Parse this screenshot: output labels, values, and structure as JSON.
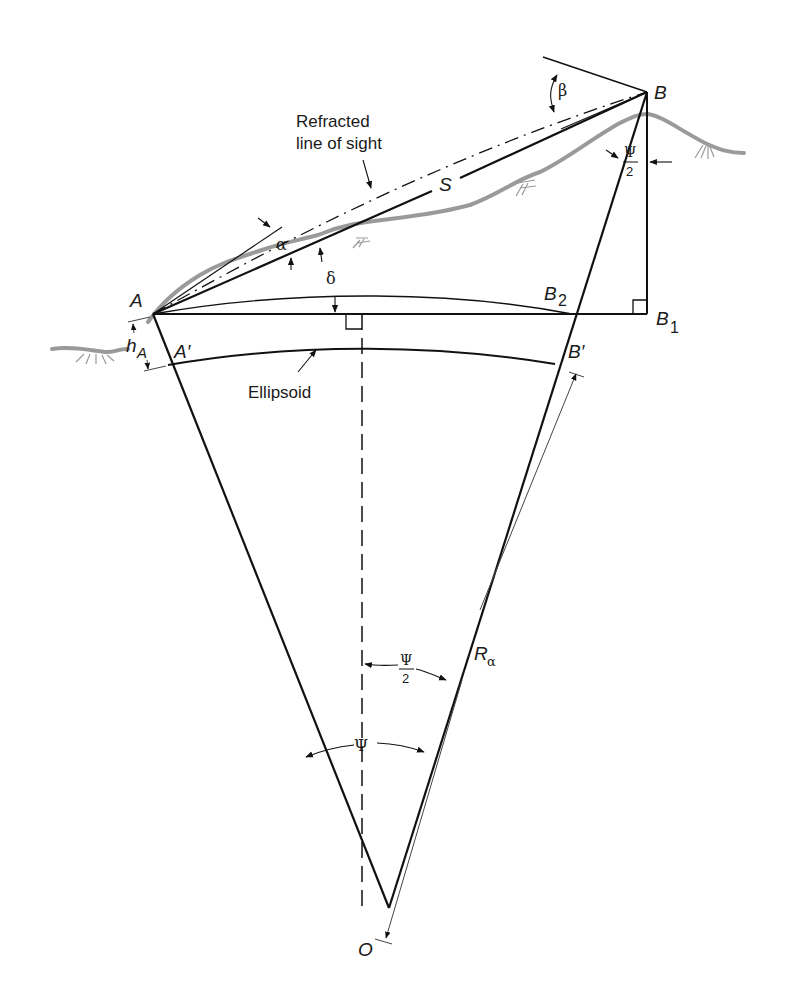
{
  "diagram": {
    "type": "geodetic-refraction-geometry",
    "colors": {
      "line": "#111111",
      "terrain": "#9a9a9a",
      "thin": "#444444",
      "background": "#ffffff"
    },
    "points": {
      "A": "A",
      "B": "B",
      "B1": "B",
      "B1_sub": "1",
      "B2": "B",
      "B2_sub": "2",
      "A_prime": "A′",
      "B_prime": "B′",
      "O": "O"
    },
    "labels": {
      "refracted_line1": "Refracted",
      "refracted_line2": "line of sight",
      "S": "S",
      "alpha": "α",
      "beta": "β",
      "delta": "δ",
      "psi": "Ψ",
      "psi_half_num": "Ψ",
      "psi_half_den": "2",
      "hA_h": "h",
      "hA_sub": "A",
      "ellipsoid": "Ellipsoid",
      "R": "R",
      "R_sub": "α"
    }
  }
}
